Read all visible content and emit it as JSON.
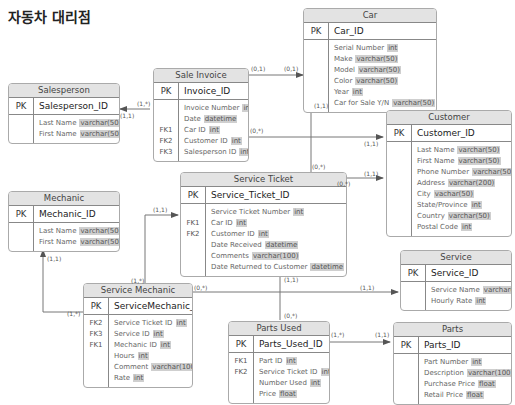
{
  "title": "자동차 대리점",
  "entities": {
    "car": {
      "name": "Car",
      "pk": "Car_ID",
      "attrs": [
        {
          "key": "",
          "name": "Serial Number",
          "type": "int"
        },
        {
          "key": "",
          "name": "Make",
          "type": "varchar(50)"
        },
        {
          "key": "",
          "name": "Model",
          "type": "varchar(50)"
        },
        {
          "key": "",
          "name": "Color",
          "type": "varchar(50)"
        },
        {
          "key": "",
          "name": "Year",
          "type": "int"
        },
        {
          "key": "",
          "name": "Car for Sale Y/N",
          "type": "varchar(50)"
        }
      ]
    },
    "salesperson": {
      "name": "Salesperson",
      "pk": "Salesperson_ID",
      "attrs": [
        {
          "key": "",
          "name": "Last Name",
          "type": "varchar(50)"
        },
        {
          "key": "",
          "name": "First Name",
          "type": "varchar(50)"
        }
      ]
    },
    "sale_invoice": {
      "name": "Sale Invoice",
      "pk": "Invoice_ID",
      "attrs": [
        {
          "key": "",
          "name": "Invoice Number",
          "type": "int"
        },
        {
          "key": "",
          "name": "Date",
          "type": "datetime"
        },
        {
          "key": "FK1",
          "name": "Car ID",
          "type": "int"
        },
        {
          "key": "FK2",
          "name": "Customer ID",
          "type": "int"
        },
        {
          "key": "FK3",
          "name": "Salesperson ID",
          "type": "int"
        }
      ]
    },
    "customer": {
      "name": "Customer",
      "pk": "Customer_ID",
      "attrs": [
        {
          "key": "",
          "name": "Last Name",
          "type": "varchar(50)"
        },
        {
          "key": "",
          "name": "First Name",
          "type": "varchar(50)"
        },
        {
          "key": "",
          "name": "Phone Number",
          "type": "varchar(50)"
        },
        {
          "key": "",
          "name": "Address",
          "type": "varchar(200)"
        },
        {
          "key": "",
          "name": "City",
          "type": "vachar(50)"
        },
        {
          "key": "",
          "name": "State/Province",
          "type": "int"
        },
        {
          "key": "",
          "name": "Country",
          "type": "varchar(50)"
        },
        {
          "key": "",
          "name": "Postal Code",
          "type": "int"
        }
      ]
    },
    "mechanic": {
      "name": "Mechanic",
      "pk": "Mechanic_ID",
      "attrs": [
        {
          "key": "",
          "name": "Last Name",
          "type": "varchar(50)"
        },
        {
          "key": "",
          "name": "First Name",
          "type": "varchar(50)"
        }
      ]
    },
    "service_ticket": {
      "name": "Service Ticket",
      "pk": "Service_Ticket_ID",
      "attrs": [
        {
          "key": "",
          "name": "Service Ticket Number",
          "type": "int"
        },
        {
          "key": "FK1",
          "name": "Car ID",
          "type": "int"
        },
        {
          "key": "FK2",
          "name": "Customer ID",
          "type": "int"
        },
        {
          "key": "",
          "name": "Date Received",
          "type": "datetime"
        },
        {
          "key": "",
          "name": "Comments",
          "type": "varchar(100)"
        },
        {
          "key": "",
          "name": "Date Returned to Customer",
          "type": "datetime"
        }
      ]
    },
    "service": {
      "name": "Service",
      "pk": "Service_ID",
      "attrs": [
        {
          "key": "",
          "name": "Service Name",
          "type": "varchar(100)"
        },
        {
          "key": "",
          "name": "Hourly Rate",
          "type": "int"
        }
      ]
    },
    "service_mechanic": {
      "name": "Service Mechanic",
      "pk": "ServiceMechanic_ID",
      "attrs": [
        {
          "key": "FK2",
          "name": "Service Ticket ID",
          "type": "int"
        },
        {
          "key": "FK3",
          "name": "Service ID",
          "type": "int"
        },
        {
          "key": "FK1",
          "name": "Mechanic ID",
          "type": "int"
        },
        {
          "key": "",
          "name": "Hours",
          "type": "int"
        },
        {
          "key": "",
          "name": "Comment",
          "type": "varchar(100)"
        },
        {
          "key": "",
          "name": "Rate",
          "type": "int"
        }
      ]
    },
    "parts_used": {
      "name": "Parts Used",
      "pk": "Parts_Used_ID",
      "attrs": [
        {
          "key": "FK1",
          "name": "Part ID",
          "type": "int"
        },
        {
          "key": "FK2",
          "name": "Service Ticket ID",
          "type": "int"
        },
        {
          "key": "",
          "name": "Number Used",
          "type": "int"
        },
        {
          "key": "",
          "name": "Price",
          "type": "float"
        }
      ]
    },
    "parts": {
      "name": "Parts",
      "pk": "Parts_ID",
      "attrs": [
        {
          "key": "",
          "name": "Part Number",
          "type": "int"
        },
        {
          "key": "",
          "name": "Description",
          "type": "varchar(100)"
        },
        {
          "key": "",
          "name": "Purchase Price",
          "type": "float"
        },
        {
          "key": "",
          "name": "Retail Price",
          "type": "float"
        }
      ]
    }
  },
  "pk_label": "PK",
  "relationships": [
    {
      "from": "Sale Invoice",
      "to": "Car",
      "from_card": "(0,1)",
      "to_card": "(0,1)"
    },
    {
      "from": "Sale Invoice",
      "to": "Salesperson",
      "from_card": "(1,*)",
      "to_card": "(1,1)"
    },
    {
      "from": "Sale Invoice",
      "to": "Customer",
      "from_card": "(0,*)",
      "to_card": "(1,1)"
    },
    {
      "from": "Service Ticket",
      "to": "Car",
      "from_card": "(0,*)",
      "to_card": "(1,1)"
    },
    {
      "from": "Service Ticket",
      "to": "Customer",
      "from_card": "(0,*)",
      "to_card": "(1,1)"
    },
    {
      "from": "Service Mechanic",
      "to": "Service Ticket",
      "from_card": "(1,*)",
      "to_card": "(1,1)"
    },
    {
      "from": "Service Mechanic",
      "to": "Mechanic",
      "from_card": "(1,*)",
      "to_card": "(1,1)"
    },
    {
      "from": "Service Mechanic",
      "to": "Service",
      "from_card": "(0,*)",
      "to_card": "(1,1)"
    },
    {
      "from": "Parts Used",
      "to": "Service Ticket",
      "from_card": "(0,*)",
      "to_card": "(1,1)"
    },
    {
      "from": "Parts Used",
      "to": "Parts",
      "from_card": "(1,*)",
      "to_card": "(1,1)"
    }
  ],
  "cards": {
    "c1": "(0,1)",
    "c2": "(0,1)",
    "c3": "(1,*)",
    "c4": "(1,1)",
    "c5": "(0,*)",
    "c6": "(1,1)",
    "c7": "(1,1)",
    "c8": "(0,*)",
    "c9": "(0,*)",
    "c10": "(1,1)",
    "c11": "(1,1)",
    "c12": "(1,*)",
    "c13": "(1,1)",
    "c14": "(1,*)",
    "c15": "(0,*)",
    "c16": "(1,1)",
    "c17": "(1,1)",
    "c18": "(0,*)",
    "c19": "(1,*)",
    "c20": "(1,1)"
  }
}
